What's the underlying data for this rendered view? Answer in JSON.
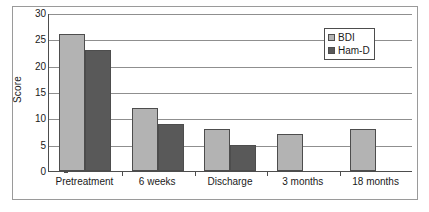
{
  "chart_data": {
    "type": "bar",
    "title": "",
    "xlabel": "",
    "ylabel": "Score",
    "ylim": [
      0,
      30
    ],
    "yticks": [
      0,
      5,
      10,
      15,
      20,
      25,
      30
    ],
    "ytick_labels": [
      "0",
      "5",
      "10",
      "15",
      "20",
      "25",
      "30"
    ],
    "grid": true,
    "grid_axis": "y",
    "legend_position": "upper-right-inside",
    "categories": [
      "Pretreatment",
      "6 weeks",
      "Discharge",
      "3 months",
      "18 months"
    ],
    "series": [
      {
        "name": "BDI",
        "color": "#b3b3b3",
        "values": [
          26,
          12,
          8,
          7,
          8
        ]
      },
      {
        "name": "Ham-D",
        "color": "#595959",
        "values": [
          23,
          9,
          5,
          null,
          null
        ]
      }
    ]
  },
  "colors": {
    "bdi": "#b3b3b3",
    "hamd": "#595959",
    "axis": "#4d4d4d",
    "gridline": "#8f8f8f",
    "frame": "#9a9a9a",
    "text": "#1a1a1a",
    "background": "#ffffff"
  }
}
